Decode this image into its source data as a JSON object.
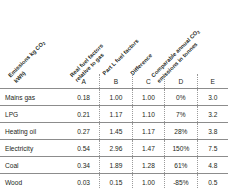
{
  "figure": {
    "type": "table",
    "column_headers_rotated": [
      {
        "key": "A",
        "lines": [
          "Emissions kg CO",
          "kWh)"
        ],
        "sub": "2",
        "label": "Emissions kg CO2 kWh)"
      },
      {
        "key": "B",
        "lines": [
          "Real fuel factors",
          "relative to gas"
        ],
        "sub": "",
        "label": "Real fuel factors relative to gas"
      },
      {
        "key": "C",
        "lines": [
          "Part L fuel factors"
        ],
        "sub": "",
        "label": "Part L fuel factors"
      },
      {
        "key": "D",
        "lines": [
          "Difference"
        ],
        "sub": "",
        "label": "Difference"
      },
      {
        "key": "E",
        "lines": [
          "Comparable annual CO",
          "emissions in tonnes"
        ],
        "sub": "2",
        "label": "Comparable annual CO2 emissions in tonnes"
      }
    ],
    "column_letters": [
      "",
      "A",
      "B",
      "C",
      "D",
      "E"
    ],
    "rows": [
      {
        "label": "Mains gas",
        "A": "0.18",
        "B": "1.00",
        "C": "1.00",
        "D": "0%",
        "E": "3.0"
      },
      {
        "label": "LPG",
        "A": "0.21",
        "B": "1.17",
        "C": "1.10",
        "D": "7%",
        "E": "3.2"
      },
      {
        "label": "Heating oil",
        "A": "0.27",
        "B": "1.45",
        "C": "1.17",
        "D": "28%",
        "E": "3.8"
      },
      {
        "label": "Electricity",
        "A": "0.54",
        "B": "2.96",
        "C": "1.47",
        "D": "150%",
        "E": "7.5"
      },
      {
        "label": "Coal",
        "A": "0.34",
        "B": "1.89",
        "C": "1.28",
        "D": "61%",
        "E": "4.8"
      },
      {
        "label": "Wood",
        "A": "0.03",
        "B": "0.15",
        "C": "1.00",
        "D": "-85%",
        "E": "0.5"
      }
    ],
    "colors": {
      "text": "#231f20",
      "rule": "#8c8c8c",
      "separator": "#9a9a9a",
      "background": "#ffffff"
    }
  },
  "chart_data": {
    "type": "table",
    "title": "",
    "categories": [
      "Mains gas",
      "LPG",
      "Heating oil",
      "Electricity",
      "Coal",
      "Wood"
    ],
    "columns": [
      "Emissions kg CO2 kWh)",
      "Real fuel factors relative to gas",
      "Part L fuel factors",
      "Difference",
      "Comparable annual CO2 emissions in tonnes"
    ],
    "column_keys": [
      "A",
      "B",
      "C",
      "D",
      "E"
    ],
    "series": [
      {
        "name": "Emissions kg CO2 kWh)",
        "key": "A",
        "values": [
          0.18,
          0.21,
          0.27,
          0.54,
          0.34,
          0.03
        ]
      },
      {
        "name": "Real fuel factors relative to gas",
        "key": "B",
        "values": [
          1.0,
          1.17,
          1.45,
          2.96,
          1.89,
          0.15
        ]
      },
      {
        "name": "Part L fuel factors",
        "key": "C",
        "values": [
          1.0,
          1.1,
          1.17,
          1.47,
          1.28,
          1.0
        ]
      },
      {
        "name": "Difference",
        "key": "D",
        "values": [
          0,
          7,
          28,
          150,
          61,
          -85
        ],
        "unit": "%"
      },
      {
        "name": "Comparable annual CO2 emissions in tonnes",
        "key": "E",
        "values": [
          3.0,
          3.2,
          3.8,
          7.5,
          4.8,
          0.5
        ]
      }
    ],
    "xlabel": "",
    "ylabel": "",
    "grid": false,
    "legend": "none"
  }
}
